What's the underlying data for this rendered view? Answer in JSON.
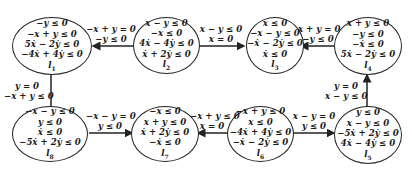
{
  "diagram": {
    "type": "hybrid-automaton",
    "stroke_color": "#222222",
    "nodes": [
      {
        "id": "l1",
        "label": "l",
        "sub": "1",
        "constraints": [
          "−y ≤ 0",
          "−x + y ≤ 0",
          "5ẋ − 2ẏ ≤ 0",
          "−4ẋ + 4ẏ ≤ 0"
        ]
      },
      {
        "id": "l2",
        "label": "l",
        "sub": "2",
        "constraints": [
          "x − y ≤ 0",
          "−x ≤ 0",
          "4ẋ − 4ẏ ≤ 0",
          "ẋ + 2ẏ ≤ 0"
        ]
      },
      {
        "id": "l3",
        "label": "l",
        "sub": "3",
        "constraints": [
          "x ≤ 0",
          "−x − y ≤ 0",
          "−ẋ − 2ẏ ≤ 0",
          "ẋ ≤ 0"
        ]
      },
      {
        "id": "l4",
        "label": "l",
        "sub": "4",
        "constraints": [
          "x + y ≤ 0",
          "−y ≤ 0",
          "−ẋ ≤ 0",
          "5ẋ − 2ẏ ≤ 0"
        ]
      },
      {
        "id": "l5",
        "label": "l",
        "sub": "5",
        "constraints": [
          "y ≤ 0",
          "x − y ≤ 0",
          "−5ẋ + 2ẏ ≤ 0",
          "4ẋ − 4ẏ ≤ 0"
        ]
      },
      {
        "id": "l6",
        "label": "l",
        "sub": "6",
        "constraints": [
          "−x + y ≤ 0",
          "x ≤ 0",
          "−4ẋ + 4ẏ ≤ 0",
          "−ẋ − 2ẏ ≤ 0"
        ]
      },
      {
        "id": "l7",
        "label": "l",
        "sub": "7",
        "constraints": [
          "−x ≤ 0",
          "x + y ≤ 0",
          "ẋ + 2ẏ ≤ 0",
          "−ẋ ≤ 0"
        ]
      },
      {
        "id": "l8",
        "label": "l",
        "sub": "8",
        "constraints": [
          "−x − y ≤ 0",
          "y ≤ 0",
          "ẋ ≤ 0",
          "−5ẋ + 2ẏ ≤ 0"
        ]
      }
    ],
    "edges": [
      {
        "from": "l2",
        "to": "l1",
        "guard": [
          "−x + y = 0",
          "−y ≤ 0"
        ]
      },
      {
        "from": "l2",
        "to": "l3",
        "guard": [
          "x − y ≤ 0",
          "x = 0"
        ]
      },
      {
        "from": "l4",
        "to": "l3",
        "guard": [
          "x + y = 0",
          "−y ≤ 0"
        ]
      },
      {
        "from": "l1",
        "to": "l8",
        "guard": [
          "y = 0",
          "−x + y ≤ 0"
        ]
      },
      {
        "from": "l5",
        "to": "l4",
        "guard": [
          "y = 0",
          "x − y ≤ 0"
        ]
      },
      {
        "from": "l8",
        "to": "l7",
        "guard": [
          "−x − y = 0",
          "y ≤ 0"
        ]
      },
      {
        "from": "l6",
        "to": "l7",
        "guard": [
          "−x + y ≤ 0",
          "x = 0"
        ]
      },
      {
        "from": "l6",
        "to": "l5",
        "guard": [
          "x − y = 0",
          "y ≤ 0"
        ]
      }
    ]
  }
}
